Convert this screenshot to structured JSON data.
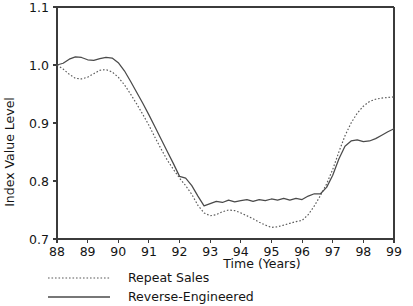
{
  "chart_data": {
    "type": "line",
    "title": "",
    "xlabel": "Time (Years)",
    "ylabel": "Index Value Level",
    "xlim": [
      88,
      99
    ],
    "ylim": [
      0.7,
      1.1
    ],
    "grid": false,
    "legend_position": "below-left",
    "xticks": [
      "88",
      "89",
      "90",
      "91",
      "92",
      "93",
      "94",
      "95",
      "96",
      "97",
      "98",
      "99"
    ],
    "yticks": [
      "0.7",
      "0.8",
      "0.9",
      "1.0",
      "1.1"
    ],
    "x": [
      88.0,
      88.2,
      88.4,
      88.6,
      88.8,
      89.0,
      89.2,
      89.4,
      89.6,
      89.8,
      90.0,
      90.2,
      90.4,
      90.6,
      90.8,
      91.0,
      91.2,
      91.4,
      91.6,
      91.8,
      92.0,
      92.2,
      92.4,
      92.6,
      92.8,
      93.0,
      93.2,
      93.4,
      93.6,
      93.8,
      94.0,
      94.2,
      94.4,
      94.6,
      94.8,
      95.0,
      95.2,
      95.4,
      95.6,
      95.8,
      96.0,
      96.2,
      96.4,
      96.6,
      96.8,
      97.0,
      97.2,
      97.4,
      97.6,
      97.8,
      98.0,
      98.2,
      98.4,
      98.6,
      98.8,
      99.0
    ],
    "series": [
      {
        "name": "Repeat Sales",
        "style": "dotted",
        "color": "#5a5a5a",
        "values": [
          1.0,
          0.993,
          0.984,
          0.977,
          0.976,
          0.979,
          0.985,
          0.991,
          0.992,
          0.988,
          0.979,
          0.966,
          0.95,
          0.933,
          0.915,
          0.896,
          0.875,
          0.855,
          0.836,
          0.82,
          0.805,
          0.792,
          0.777,
          0.758,
          0.745,
          0.74,
          0.742,
          0.747,
          0.75,
          0.749,
          0.745,
          0.74,
          0.735,
          0.729,
          0.724,
          0.72,
          0.721,
          0.724,
          0.727,
          0.73,
          0.732,
          0.742,
          0.757,
          0.775,
          0.795,
          0.82,
          0.85,
          0.878,
          0.9,
          0.917,
          0.929,
          0.937,
          0.941,
          0.943,
          0.944,
          0.945
        ]
      },
      {
        "name": "Reverse-Engineered",
        "style": "solid",
        "color": "#4a4a4a",
        "values": [
          1.0,
          1.003,
          1.01,
          1.014,
          1.013,
          1.009,
          1.008,
          1.011,
          1.013,
          1.012,
          1.004,
          0.99,
          0.972,
          0.953,
          0.934,
          0.914,
          0.893,
          0.872,
          0.851,
          0.83,
          0.808,
          0.805,
          0.792,
          0.774,
          0.757,
          0.761,
          0.765,
          0.763,
          0.767,
          0.764,
          0.766,
          0.768,
          0.765,
          0.768,
          0.766,
          0.769,
          0.767,
          0.77,
          0.767,
          0.77,
          0.768,
          0.774,
          0.778,
          0.778,
          0.789,
          0.81,
          0.838,
          0.86,
          0.869,
          0.871,
          0.868,
          0.869,
          0.873,
          0.879,
          0.885,
          0.89
        ]
      }
    ],
    "legend": [
      {
        "label": "Repeat Sales",
        "style": "dotted"
      },
      {
        "label": "Reverse-Engineered",
        "style": "solid"
      }
    ]
  },
  "plot_geometry": {
    "left": 57,
    "right": 394,
    "top": 7,
    "bottom": 239
  }
}
